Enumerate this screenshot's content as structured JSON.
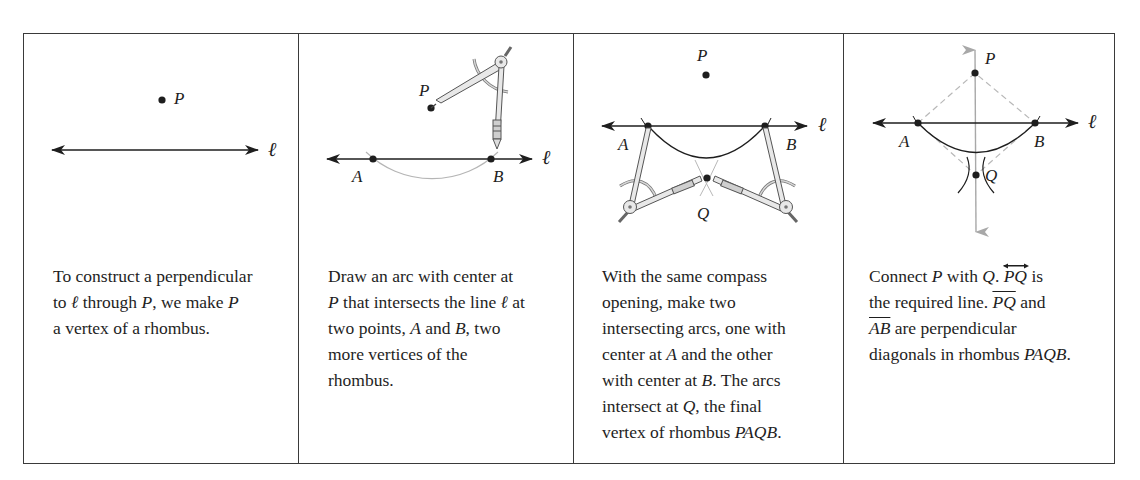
{
  "figure": {
    "type": "geometric-construction",
    "panels": [
      {
        "step": 1,
        "labels": {
          "point_p": "P",
          "line": "ℓ"
        },
        "caption": {
          "line1": "To construct a perpendicular",
          "line2_a": "to ",
          "line2_ell": "ℓ",
          "line2_b": " through ",
          "line2_p": "P",
          "line2_c": ", we make ",
          "line2_p2": "P",
          "line3": "a vertex of a rhombus."
        }
      },
      {
        "step": 2,
        "labels": {
          "point_p": "P",
          "point_a": "A",
          "point_b": "B",
          "line": "ℓ"
        },
        "caption": {
          "line1": "Draw an arc with center at",
          "line2_p": "P",
          "line2_a": " that intersects the line ",
          "line2_ell": "ℓ",
          "line2_b": " at",
          "line3_a": "two points, ",
          "line3_A": "A",
          "line3_b": " and ",
          "line3_B": "B",
          "line3_c": ", two",
          "line4": "more vertices of the",
          "line5": "rhombus."
        }
      },
      {
        "step": 3,
        "labels": {
          "point_p": "P",
          "point_a": "A",
          "point_b": "B",
          "point_q": "Q",
          "line": "ℓ"
        },
        "caption": {
          "line1": "With the same compass",
          "line2": "opening, make two",
          "line3": "intersecting arcs, one with",
          "line4_a": "center at ",
          "line4_A": "A",
          "line4_b": " and the other",
          "line5_a": "with center at ",
          "line5_B": "B",
          "line5_b": ". The arcs",
          "line6_a": "intersect at ",
          "line6_Q": "Q",
          "line6_b": ", the final",
          "line7_a": "vertex of rhombus ",
          "line7_name": "PAQB",
          "line7_b": "."
        }
      },
      {
        "step": 4,
        "labels": {
          "point_p": "P",
          "point_a": "A",
          "point_b": "B",
          "point_q": "Q",
          "line": "ℓ"
        },
        "caption": {
          "line1_a": "Connect ",
          "line1_P": "P",
          "line1_b": " with ",
          "line1_Q": "Q",
          "line1_c": ". ",
          "line1_PQ": "PQ",
          "line1_d": " is",
          "line2_a": "the required line. ",
          "line2_PQ": "PQ",
          "line2_b": " and",
          "line3_AB": "AB",
          "line3_a": " are perpendicular",
          "line4_a": "diagonals in rhombus ",
          "line4_name": "PAQB",
          "line4_b": "."
        }
      }
    ],
    "colors": {
      "ink": "#1e1e1e",
      "construction_gray": "#a8a8a8",
      "frame": "#3a3a3a"
    }
  }
}
